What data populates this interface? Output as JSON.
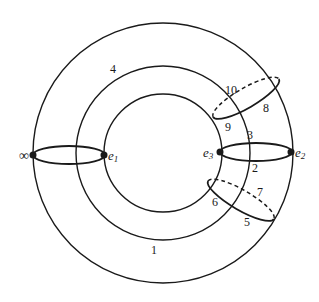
{
  "diagram": {
    "colors": {
      "stroke": "#1a1a1a",
      "background": "#ffffff"
    },
    "vertices": {
      "infinity": "∞",
      "e1": "e",
      "e1_sub": "1",
      "e2": "e",
      "e2_sub": "2",
      "e3": "e",
      "e3_sub": "3"
    },
    "edge_labels": {
      "l1": "1",
      "l2": "2",
      "l3": "3",
      "l4": "4",
      "l5": "5",
      "l6": "6",
      "l7": "7",
      "l8": "8",
      "l9": "9",
      "l10": "10"
    }
  }
}
